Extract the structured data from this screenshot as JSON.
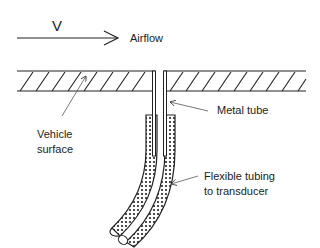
{
  "diagram": {
    "velocity_symbol": "V",
    "airflow_label": "Airflow",
    "metal_tube_label": "Metal tube",
    "vehicle_surface_label": [
      "Vehicle",
      "surface"
    ],
    "flexible_tubing_label": [
      "Flexible tubing",
      "to transducer"
    ]
  }
}
